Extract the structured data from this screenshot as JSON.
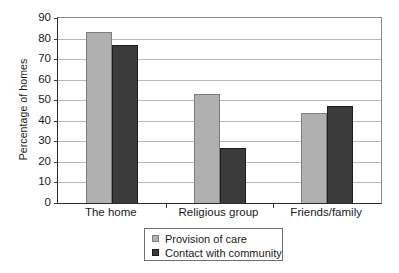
{
  "chart_data": {
    "type": "bar",
    "title": "",
    "xlabel": "",
    "ylabel": "Percentage of homes",
    "ylim": [
      0,
      90
    ],
    "ytick_step": 10,
    "yticks": [
      0,
      10,
      20,
      30,
      40,
      50,
      60,
      70,
      80,
      90
    ],
    "grid": true,
    "legend_position": "bottom-center",
    "categories": [
      "The home",
      "Religious group",
      "Friends/family"
    ],
    "series": [
      {
        "name": "Provision of care",
        "color": "#b0b0b0",
        "values": [
          83,
          53,
          44
        ]
      },
      {
        "name": "Contact with community",
        "color": "#3b3b3b",
        "values": [
          77,
          27,
          47
        ]
      }
    ]
  },
  "axis": {
    "y_tick_labels": [
      "0",
      "10",
      "20",
      "30",
      "40",
      "50",
      "60",
      "70",
      "80",
      "90"
    ],
    "y_title": "Percentage of homes"
  },
  "legend": {
    "items": [
      {
        "label": "Provision of care",
        "swatch": "light-gray-square"
      },
      {
        "label": "Contact with community",
        "swatch": "dark-gray-square"
      }
    ]
  }
}
